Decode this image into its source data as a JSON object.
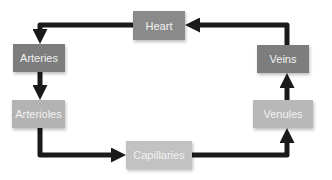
{
  "diagram": {
    "title": "",
    "nodes": [
      {
        "id": "heart",
        "label": "Heart",
        "color": "#8a8a8a"
      },
      {
        "id": "arteries",
        "label": "Arteries",
        "color": "#7d7d7d"
      },
      {
        "id": "arterioles",
        "label": "Arterioles",
        "color": "#b3b3b3"
      },
      {
        "id": "capillaries",
        "label": "Capillaries",
        "color": "#c2c2c2"
      },
      {
        "id": "venules",
        "label": "Venules",
        "color": "#b8b8b8"
      },
      {
        "id": "veins",
        "label": "Veins",
        "color": "#7d7d7d"
      }
    ],
    "edges": [
      {
        "from": "heart",
        "to": "arteries"
      },
      {
        "from": "arteries",
        "to": "arterioles"
      },
      {
        "from": "arterioles",
        "to": "capillaries"
      },
      {
        "from": "capillaries",
        "to": "venules"
      },
      {
        "from": "venules",
        "to": "veins"
      },
      {
        "from": "veins",
        "to": "heart"
      }
    ],
    "arrow_color": "#1a1a1a"
  }
}
